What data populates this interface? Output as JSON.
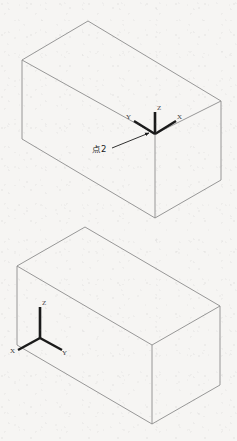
{
  "scene": {
    "title": "Isometric wireframe boxes with coordinate axis triads",
    "background_color": "#f6f5f3",
    "edge_color": "#8c8c8c",
    "axis_color": "#1a1a1a",
    "annotation_color": "#1a1a1a"
  },
  "annotations": [
    {
      "id": "point2",
      "label": "点2",
      "leader_from": [
        113,
        147
      ],
      "leader_to": [
        150,
        132
      ],
      "arrow_at": [
        150,
        132
      ]
    }
  ],
  "objects": [
    {
      "id": "box-upper",
      "name": "upper-box",
      "type": "wireframe-box",
      "vertices": {
        "top_left": [
          22,
          60
        ],
        "top_apex": [
          88,
          21
        ],
        "top_right": [
          221,
          101
        ],
        "mid_front": [
          155,
          134
        ],
        "bottom_left": [
          22,
          139
        ],
        "bottom_front": [
          155,
          218
        ],
        "bottom_right": [
          221,
          180
        ]
      },
      "axis_triad": {
        "id": "triad-upper",
        "origin": [
          155,
          134
        ],
        "axes": [
          {
            "name": "Z",
            "label": "Z",
            "tip": [
              155,
              112
            ],
            "label_pos": [
              157,
              107
            ]
          },
          {
            "name": "Y",
            "label": "Y",
            "tip": [
              134,
              121
            ],
            "label_pos": [
              128,
              117
            ]
          },
          {
            "name": "X",
            "label": "X",
            "tip": [
              176,
              121
            ],
            "label_pos": [
              177,
              117
            ]
          }
        ]
      }
    },
    {
      "id": "box-lower",
      "name": "lower-box",
      "type": "wireframe-box",
      "vertices": {
        "top_left": [
          17,
          266
        ],
        "top_apex": [
          85,
          227
        ],
        "top_right": [
          220,
          306
        ],
        "mid_front": [
          152,
          345
        ],
        "bottom_left": [
          17,
          345
        ],
        "bottom_front": [
          152,
          424
        ],
        "bottom_right": [
          220,
          385
        ]
      },
      "axis_triad": {
        "id": "triad-lower",
        "origin": [
          40,
          338
        ],
        "axes": [
          {
            "name": "Z",
            "label": "Z",
            "tip": [
              40,
              307
            ],
            "label_pos": [
              42,
              302
            ]
          },
          {
            "name": "X",
            "label": "X",
            "tip": [
              18,
              350
            ],
            "label_pos": [
              12,
              351
            ]
          },
          {
            "name": "Y",
            "label": "Y",
            "tip": [
              62,
              350
            ],
            "label_pos": [
              62,
              352
            ]
          }
        ]
      }
    }
  ]
}
